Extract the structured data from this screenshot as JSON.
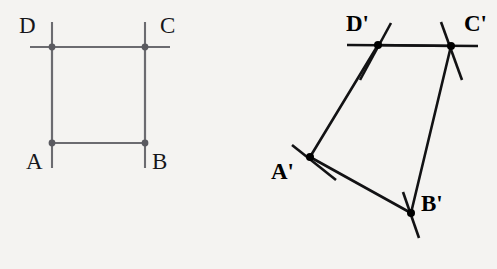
{
  "canvas": {
    "width": 497,
    "height": 269,
    "background_color": "#f4f3f1"
  },
  "figures": [
    {
      "name": "pre-image-square",
      "label_suffix": "",
      "stroke_color": "#6b6b70",
      "stroke_width": 2.1,
      "dot_color": "#5a5a60",
      "dot_radius": 3.4,
      "vertices": [
        {
          "id": "A",
          "label": "A",
          "x": 52,
          "y": 143,
          "label_x": 26,
          "label_y": 150
        },
        {
          "id": "B",
          "label": "B",
          "x": 145,
          "y": 143,
          "label_x": 152,
          "label_y": 150
        },
        {
          "id": "C",
          "label": "C",
          "x": 145,
          "y": 47,
          "label_x": 160,
          "label_y": 14
        },
        {
          "id": "D",
          "label": "D",
          "x": 52,
          "y": 47,
          "label_x": 19,
          "label_y": 14
        }
      ],
      "edges": [
        {
          "from": "A",
          "to": "B"
        },
        {
          "from": "B",
          "to": "C"
        },
        {
          "from": "C",
          "to": "D"
        },
        {
          "from": "D",
          "to": "A"
        }
      ],
      "ticks": [
        {
          "at": "D",
          "x1": 30,
          "y1": 47,
          "x2": 170,
          "y2": 47
        },
        {
          "at": "D",
          "x1": 52,
          "y1": 22,
          "x2": 52,
          "y2": 168
        },
        {
          "at": "C",
          "x1": 145,
          "y1": 22,
          "x2": 145,
          "y2": 168
        }
      ]
    },
    {
      "name": "image-quadrilateral",
      "label_suffix": "'",
      "stroke_color": "#121214",
      "stroke_width": 2.6,
      "dot_color": "#000000",
      "dot_radius": 4.0,
      "vertices": [
        {
          "id": "Ap",
          "label": "A'",
          "x": 310,
          "y": 157,
          "label_x": 271,
          "label_y": 160
        },
        {
          "id": "Bp",
          "label": "B'",
          "x": 411,
          "y": 213,
          "label_x": 421,
          "label_y": 192
        },
        {
          "id": "Cp",
          "label": "C'",
          "x": 451,
          "y": 46,
          "label_x": 464,
          "label_y": 12
        },
        {
          "id": "Dp",
          "label": "D'",
          "x": 378,
          "y": 45,
          "label_x": 346,
          "label_y": 12
        }
      ],
      "edges": [
        {
          "from": "Ap",
          "to": "Bp"
        },
        {
          "from": "Bp",
          "to": "Cp"
        },
        {
          "from": "Cp",
          "to": "Dp"
        },
        {
          "from": "Dp",
          "to": "Ap"
        }
      ],
      "ticks": [
        {
          "at": "Dp",
          "x1": 347,
          "y1": 45,
          "x2": 478,
          "y2": 46
        },
        {
          "at": "Dp",
          "x1": 391,
          "y1": 23,
          "x2": 360,
          "y2": 80
        },
        {
          "at": "Cp",
          "x1": 441,
          "y1": 22,
          "x2": 462,
          "y2": 80
        },
        {
          "at": "Ap",
          "x1": 292,
          "y1": 145,
          "x2": 336,
          "y2": 180
        },
        {
          "at": "Bp",
          "x1": 403,
          "y1": 192,
          "x2": 419,
          "y2": 238
        }
      ]
    }
  ],
  "geometry_notes": {
    "pre_image_name": "ABCD",
    "image_name": "A'B'C'D'",
    "pre_image_shape": "square",
    "image_shape": "quadrilateral"
  }
}
